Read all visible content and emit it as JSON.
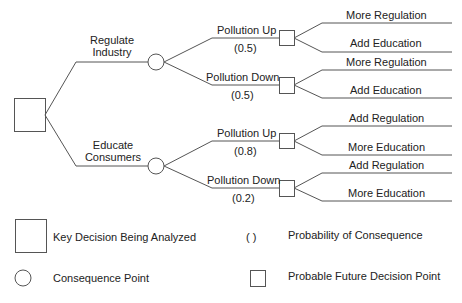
{
  "diagram": {
    "type": "decision-tree",
    "root": {
      "shape": "square",
      "meaning": "Key Decision Being Analyzed"
    },
    "decisions": [
      {
        "label_line1": "Regulate",
        "label_line2": "Industry",
        "consequences": [
          {
            "label": "Pollution Up",
            "probability": "(0.5)",
            "options": [
              "More Regulation",
              "Add Education"
            ]
          },
          {
            "label": "Pollution Down",
            "probability": "(0.5)",
            "options": [
              "More Regulation",
              "Add Education"
            ]
          }
        ]
      },
      {
        "label_line1": "Educate",
        "label_line2": "Consumers",
        "consequences": [
          {
            "label": "Pollution Up",
            "probability": "(0.8)",
            "options": [
              "Add Regulation",
              "More Education"
            ]
          },
          {
            "label": "Pollution Down",
            "probability": "(0.2)",
            "options": [
              "Add Regulation",
              "More Education"
            ]
          }
        ]
      }
    ]
  },
  "legend": {
    "key_decision": "Key Decision Being Analyzed",
    "probability_symbol": "(   )",
    "probability": "Probability of Consequence",
    "consequence_point": "Consequence Point",
    "future_decision": "Probable Future Decision Point"
  },
  "colors": {
    "line": "#555555",
    "text": "#222222",
    "background": "#ffffff"
  }
}
